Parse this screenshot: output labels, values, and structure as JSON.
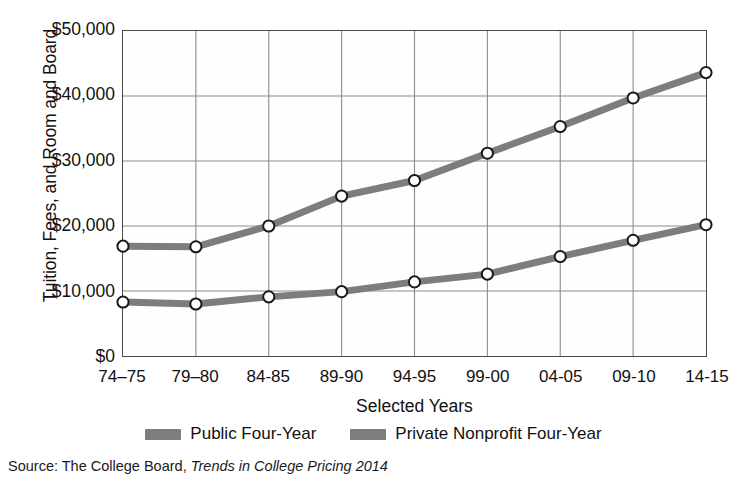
{
  "chart_data": {
    "type": "line",
    "title": "",
    "xlabel": "Selected Years",
    "ylabel": "Tuition, Fees, and Room and Board",
    "categories": [
      "74–75",
      "79–80",
      "84-85",
      "89-90",
      "94-95",
      "99-00",
      "04-05",
      "09-10",
      "14-15"
    ],
    "series": [
      {
        "name": "Public Four-Year",
        "color": "#7d7d7d",
        "values": [
          8300,
          8000,
          9100,
          9900,
          11400,
          12600,
          15300,
          17800,
          20200
        ]
      },
      {
        "name": "Private Nonprofit Four-Year",
        "color": "#7d7d7d",
        "values": [
          16900,
          16800,
          20000,
          24600,
          27000,
          31200,
          35300,
          39700,
          43600
        ]
      }
    ],
    "ylim": [
      0,
      50000
    ],
    "yticks": [
      0,
      10000,
      20000,
      30000,
      40000,
      50000
    ],
    "ytick_labels": [
      "$0",
      "$10,000",
      "$20,000",
      "$30,000",
      "$40,000",
      "$50,000"
    ],
    "grid": true,
    "grid_color": "#8c8c8c",
    "legend_position": "bottom",
    "marker": "open-circle",
    "marker_face_color": "#ffffff",
    "marker_edge_color": "#1a1a1a"
  },
  "axis": {
    "y_title": "Tuition, Fees, and Room and Board",
    "x_title": "Selected Years"
  },
  "legend": {
    "items": [
      {
        "label": "Public Four-Year",
        "color": "#7d7d7d"
      },
      {
        "label": "Private Nonprofit Four-Year",
        "color": "#7d7d7d"
      }
    ]
  },
  "source": {
    "prefix": "Source: The College Board,",
    "title_italic": "Trends in College Pricing 2014"
  }
}
